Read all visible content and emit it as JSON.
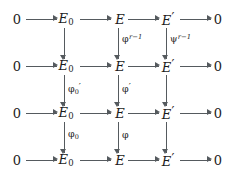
{
  "diagram": {
    "kind": "commutative-diagram",
    "colors": {
      "background": "#ffffff",
      "text": "#1c1c1c",
      "arrow": "#555a5e"
    },
    "nodes": {
      "zero": "0",
      "e_zero_base": "E",
      "e_zero_sub": "0",
      "e": "E",
      "e_prime_base": "E",
      "prime": "′"
    },
    "rows": [
      {
        "id": "row-1",
        "cells": [
          "0",
          "E₀",
          "E",
          "E′",
          "0"
        ]
      },
      {
        "id": "row-2",
        "cells": [
          "0",
          "E₀",
          "E",
          "E′",
          "0"
        ]
      },
      {
        "id": "row-3",
        "cells": [
          "0",
          "E₀",
          "E",
          "E′",
          "0"
        ]
      },
      {
        "id": "row-4",
        "cells": [
          "0",
          "E₀",
          "E",
          "E′",
          "0"
        ]
      }
    ],
    "vertical_labels": {
      "gap_1_col_e": {
        "base": "φ",
        "sup": "r−1"
      },
      "gap_1_col_eprime": {
        "base": "ψ",
        "sup": "r−1"
      },
      "gap_2_col_e0": {
        "base": "φ",
        "sub": "0",
        "prime": "′"
      },
      "gap_2_col_e": {
        "base": "φ",
        "prime": "′"
      },
      "gap_3_col_e0": {
        "base": "φ",
        "sub": "0"
      },
      "gap_3_col_e": {
        "base": "φ"
      }
    }
  }
}
